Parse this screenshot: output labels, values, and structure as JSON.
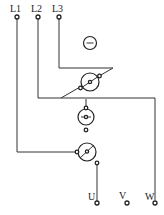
{
  "diagram": {
    "type": "three-phase wiring diagram",
    "colors": {
      "line": "#333333",
      "background": "#ffffff"
    },
    "inputs": [
      {
        "label": "L1",
        "x": 17
      },
      {
        "label": "L2",
        "x": 38
      },
      {
        "label": "L3",
        "x": 59
      }
    ],
    "outputs": [
      {
        "label": "U",
        "x": 97
      },
      {
        "label": "V",
        "x": 127
      },
      {
        "label": "W",
        "x": 155
      }
    ],
    "components": [
      {
        "id": "indicator-minus",
        "symbol": "circle-with-minus"
      },
      {
        "id": "switch-top",
        "symbol": "circle-with-diagonal-contact"
      },
      {
        "id": "switch-middle",
        "symbol": "circle-with-horizontal-contact"
      },
      {
        "id": "switch-bottom",
        "symbol": "circle-with-diagonal-contact"
      }
    ]
  }
}
